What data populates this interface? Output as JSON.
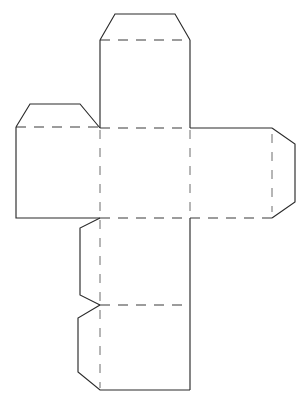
{
  "document": {
    "title": "Cube Net Template",
    "kind": "papercraft-net",
    "background_color": "#ffffff",
    "cut_line_color": "#2b2b2b",
    "fold_line_color": "#3a3a3a",
    "fold_line_light_color": "#6d6d6d",
    "canvas": {
      "width": 298,
      "height": 398
    }
  },
  "geometry": {
    "center_face": {
      "left": 100,
      "right": 190,
      "top": 128,
      "bottom": 218
    },
    "cut_outline": "M 115 14 L 175 14 L 190 40 L 190 128 L 272 128 L 295 144 L 295 202 L 272 218 L 190 218 L 190 390 L 100 390 L 78 372 L 78 318 L 100 305 L 80 295 L 80 228 L 100 218 L 16 218 L 16 127 L 30 104 L 80 104 L 100 128 L 100 40 Z",
    "fold_lines": [
      {
        "name": "top-tab-fold",
        "x1": 100,
        "y1": 40,
        "x2": 190,
        "y2": 40,
        "orientation": "horizontal",
        "weight": "heavy"
      },
      {
        "name": "top-face-fold",
        "x1": 100,
        "y1": 128,
        "x2": 190,
        "y2": 128,
        "orientation": "horizontal",
        "weight": "heavy"
      },
      {
        "name": "left-flap-fold",
        "x1": 16,
        "y1": 127,
        "x2": 100,
        "y2": 127,
        "orientation": "horizontal",
        "weight": "heavy"
      },
      {
        "name": "bottom-face-fold",
        "x1": 100,
        "y1": 218,
        "x2": 190,
        "y2": 218,
        "orientation": "horizontal",
        "weight": "heavy"
      },
      {
        "name": "right-face-fold",
        "x1": 190,
        "y1": 218,
        "x2": 272,
        "y2": 218,
        "orientation": "horizontal",
        "weight": "heavy"
      },
      {
        "name": "lower-panel-fold",
        "x1": 100,
        "y1": 305,
        "x2": 190,
        "y2": 305,
        "orientation": "horizontal",
        "weight": "heavy"
      },
      {
        "name": "center-left-vertical-fold",
        "x1": 100,
        "y1": 128,
        "x2": 100,
        "y2": 218,
        "orientation": "vertical",
        "weight": "light"
      },
      {
        "name": "center-right-vertical-fold",
        "x1": 190,
        "y1": 128,
        "x2": 190,
        "y2": 218,
        "orientation": "vertical",
        "weight": "light"
      },
      {
        "name": "right-tab-vertical-fold",
        "x1": 272,
        "y1": 132,
        "x2": 272,
        "y2": 214,
        "orientation": "vertical",
        "weight": "light"
      },
      {
        "name": "lower-column-vertical-fold",
        "x1": 100,
        "y1": 218,
        "x2": 100,
        "y2": 390,
        "orientation": "vertical",
        "weight": "light"
      }
    ],
    "panels": [
      {
        "name": "top-glue-tab",
        "shape": "trapezoid",
        "points": "115,14 175,14 190,40 100,40"
      },
      {
        "name": "top-face",
        "shape": "square",
        "points": "100,40 190,40 190,128 100,128"
      },
      {
        "name": "left-glue-tab",
        "shape": "trapezoid",
        "points": "30,104 80,104 100,127 16,127"
      },
      {
        "name": "left-face",
        "shape": "square",
        "points": "16,127 100,127 100,218 16,218"
      },
      {
        "name": "center-face",
        "shape": "square",
        "points": "100,128 190,128 190,218 100,218"
      },
      {
        "name": "right-face",
        "shape": "square",
        "points": "190,128 272,128 272,218 190,218"
      },
      {
        "name": "right-glue-tab",
        "shape": "trapezoid",
        "points": "272,128 295,144 295,202 272,218"
      },
      {
        "name": "lower-face",
        "shape": "notched-square",
        "points": "100,218 190,218 190,305 100,305 80,295 80,228"
      },
      {
        "name": "bottom-face",
        "shape": "beveled-square",
        "points": "100,305 190,305 190,390 100,390 78,372 78,318"
      }
    ]
  },
  "legend": {
    "cut_label": "Cut line (solid)",
    "fold_label": "Fold line (dashed)"
  }
}
